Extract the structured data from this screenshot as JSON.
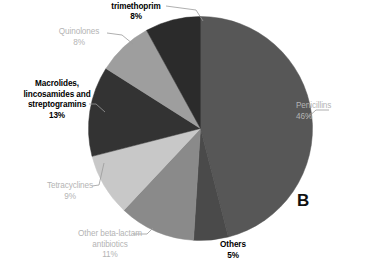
{
  "panel": {
    "letter": "B"
  },
  "chart_data": {
    "type": "pie",
    "title": "",
    "subtitle": "",
    "xlabel": "",
    "ylabel": "",
    "legend_position": "none",
    "grid": false,
    "units": "percent",
    "start_angle_deg": 0,
    "direction": "clockwise",
    "categories": [
      "Penicillins",
      "Others",
      "Other beta-lactam antibiotics",
      "Tetracyclines",
      "Macrolides, lincosamides and streptogramins",
      "Quinolones",
      "Sulphonamides and trimethoprim"
    ],
    "values": [
      46,
      5,
      11,
      9,
      13,
      8,
      8
    ],
    "colors": [
      "#575757",
      "#4a4a4a",
      "#8a8a8a",
      "#c8c8c8",
      "#333333",
      "#9e9e9e",
      "#2b2b2b"
    ],
    "slices": [
      {
        "label": "Penicillins",
        "value": 46,
        "display": "46%",
        "color": "#575757"
      },
      {
        "label": "Others",
        "value": 5,
        "display": "5%",
        "color": "#4a4a4a"
      },
      {
        "label": "Other beta-lactam antibiotics",
        "value": 11,
        "display": "11%",
        "color": "#8a8a8a"
      },
      {
        "label": "Tetracyclines",
        "value": 9,
        "display": "9%",
        "color": "#c8c8c8"
      },
      {
        "label": "Macrolides, lincosamides and streptogramins",
        "value": 13,
        "display": "13%",
        "color": "#333333"
      },
      {
        "label": "Quinolones",
        "value": 8,
        "display": "8%",
        "color": "#9e9e9e"
      },
      {
        "label": "Sulphonamides and trimethoprim",
        "value": 8,
        "display": "8%",
        "color": "#2b2b2b"
      }
    ]
  },
  "labels": {
    "sulphonamides": {
      "line1": "Sulphonamides and",
      "line2": "trimethoprim",
      "pct": "8%"
    },
    "quinolones": {
      "line1": "Quinolones",
      "pct": "8%"
    },
    "macrolides": {
      "line1": "Macrolides,",
      "line2": "lincosamides and",
      "line3": "streptogramins",
      "pct": "13%"
    },
    "tetracyclines": {
      "line1": "Tetracyclines",
      "pct": "9%"
    },
    "beta_lactam": {
      "line1": "Other beta-lactam",
      "line2": "antibiotics",
      "pct": "11%"
    },
    "others": {
      "line1": "Others",
      "pct": "5%"
    },
    "penicillins": {
      "line1": "Penicillins",
      "pct": "46%"
    }
  }
}
